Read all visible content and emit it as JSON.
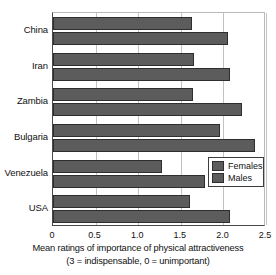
{
  "chart_data": {
    "type": "bar",
    "orientation": "horizontal",
    "title": "",
    "xlabel": "Mean ratings of importance of physical attractiveness",
    "xlabel_note": "(3 = indispensable, 0 = unimportant)",
    "ylabel": "",
    "categories": [
      "China",
      "Iran",
      "Zambia",
      "Bulgaria",
      "Venezuela",
      "USA"
    ],
    "series": [
      {
        "name": "Females",
        "values": [
          1.63,
          1.66,
          1.64,
          1.96,
          1.28,
          1.61
        ]
      },
      {
        "name": "Males",
        "values": [
          2.05,
          2.08,
          2.22,
          2.37,
          1.78,
          2.08
        ]
      }
    ],
    "xlim": [
      0,
      2.5
    ],
    "xticks": [
      0,
      0.5,
      1.0,
      1.5,
      2.0,
      2.5
    ],
    "xtick_labels": [
      "0",
      "0.5",
      "1.0",
      "1.5",
      "2.0",
      "2.5"
    ],
    "grid": true,
    "grid_axis": "x",
    "legend_position": "center-right",
    "bar_color": "#5c5c5c",
    "bar_edge_color": "#2e2e2e",
    "background": "#ffffff"
  },
  "legend": {
    "items": [
      {
        "label": "Females"
      },
      {
        "label": "Males"
      }
    ]
  }
}
